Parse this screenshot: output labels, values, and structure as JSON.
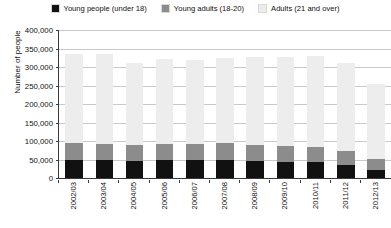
{
  "chart_data": {
    "type": "bar",
    "subtype": "stacked-vertical",
    "title": "",
    "xlabel": "",
    "ylabel": "Number of people",
    "ylim": [
      0,
      400000
    ],
    "ytick_step": 50000,
    "ytick_labels": [
      "400,000",
      "350,000",
      "300,000",
      "250,000",
      "200,000",
      "150,000",
      "100,000",
      "50,000",
      "0"
    ],
    "ytick_values": [
      400000,
      350000,
      300000,
      250000,
      200000,
      150000,
      100000,
      50000,
      0
    ],
    "grid": true,
    "legend_position": "top",
    "categories": [
      "2002/03",
      "2003/04",
      "2004/05",
      "2005/06",
      "2006/07",
      "2007/08",
      "2008/09",
      "2009/10",
      "2010/11",
      "2011/12",
      "2012/13"
    ],
    "series": [
      {
        "name": "Young people (under 18)",
        "color": "#111111",
        "values": [
          48000,
          48000,
          47000,
          48000,
          48000,
          49000,
          47000,
          44000,
          43000,
          35000,
          22000
        ]
      },
      {
        "name": "Young adults (18-20)",
        "color": "#8c8c8c",
        "values": [
          46000,
          44000,
          43000,
          44000,
          44000,
          45000,
          43000,
          42000,
          42000,
          38000,
          29000
        ]
      },
      {
        "name": "Adults (21 and over)",
        "color": "#ededed",
        "values": [
          241000,
          242000,
          222000,
          230000,
          226000,
          231000,
          237000,
          240000,
          245000,
          238000,
          204000
        ]
      }
    ],
    "totals": [
      335000,
      334000,
      312000,
      322000,
      318000,
      325000,
      327000,
      326000,
      330000,
      311000,
      255000
    ]
  },
  "legend": {
    "items": [
      {
        "label": "Young people (under 18)",
        "color": "#111111"
      },
      {
        "label": "Young adults (18-20)",
        "color": "#8c8c8c"
      },
      {
        "label": "Adults (21 and over)",
        "color": "#ededed"
      }
    ]
  },
  "colors": {
    "axis": "#3a3a3a",
    "grid": "#c9c9c9",
    "background": "#ffffff",
    "text": "#111111"
  }
}
